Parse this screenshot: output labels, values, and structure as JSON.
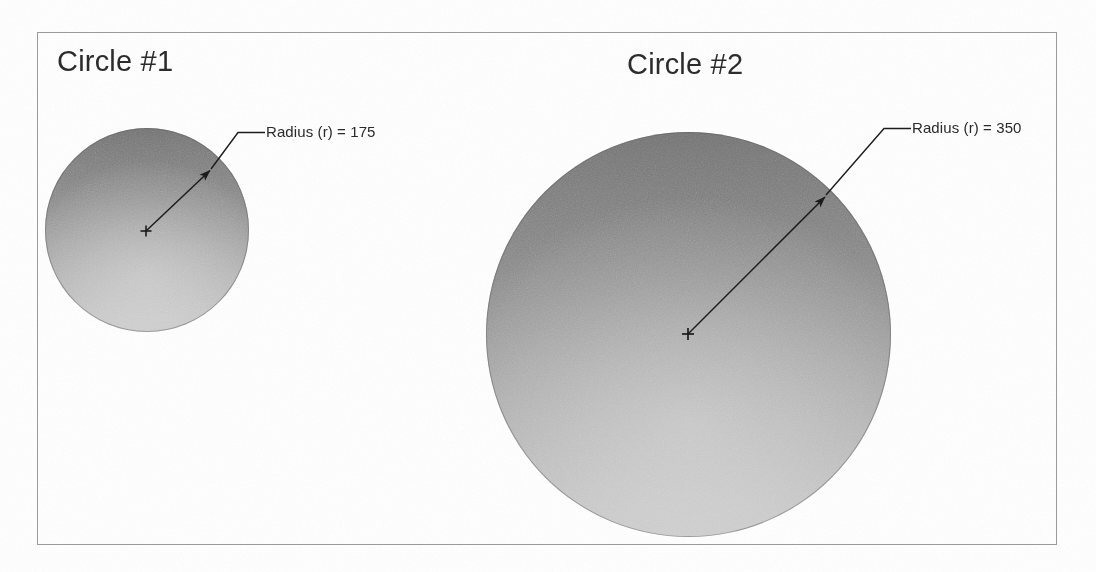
{
  "figure": {
    "background_color": "#ffffff",
    "frame_color": "#9a9a9a"
  },
  "circles": [
    {
      "title": "Circle #1",
      "radius_label": "Radius (r) = 175",
      "radius_value": 175,
      "fill_top_color": "#7f7f7f",
      "fill_bottom_color": "#c8c8c8",
      "center_marker": "plus-marker"
    },
    {
      "title": "Circle #2",
      "radius_label": "Radius (r) = 350",
      "radius_value": 350,
      "fill_top_color": "#7f7f7f",
      "fill_bottom_color": "#c8c8c8",
      "center_marker": "plus-marker"
    }
  ]
}
